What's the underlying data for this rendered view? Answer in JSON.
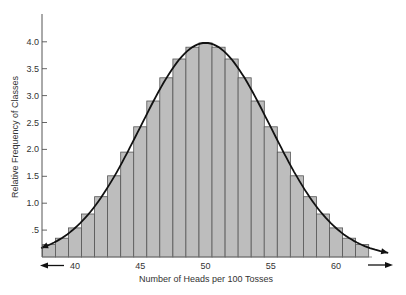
{
  "chart_data": {
    "type": "bar",
    "title": "",
    "xlabel": "Number of Heads per 100 Tosses",
    "ylabel": "Relative Frequency of Classes",
    "categories": [
      38,
      39,
      40,
      41,
      42,
      43,
      44,
      45,
      46,
      47,
      48,
      49,
      50,
      51,
      52,
      53,
      54,
      55,
      56,
      57,
      58,
      59,
      60,
      61,
      62
    ],
    "values": [
      0.23,
      0.35,
      0.54,
      0.8,
      1.12,
      1.51,
      1.95,
      2.42,
      2.9,
      3.33,
      3.68,
      3.9,
      3.98,
      3.9,
      3.68,
      3.33,
      2.9,
      2.42,
      1.95,
      1.51,
      1.12,
      0.8,
      0.54,
      0.35,
      0.23
    ],
    "overlay": {
      "type": "line",
      "name": "normal curve",
      "shape": "bell",
      "arrows_both_ends": true
    },
    "x_ticks": [
      40,
      45,
      50,
      55,
      60
    ],
    "y_ticks": [
      ".5",
      "1.0",
      "1.5",
      "2.0",
      "2.5",
      "3.0",
      "3.5",
      "4.0"
    ],
    "y_tick_values": [
      0.5,
      1.0,
      1.5,
      2.0,
      2.5,
      3.0,
      3.5,
      4.0
    ],
    "ylim": [
      0,
      4.5
    ],
    "xlim": [
      37.5,
      62.5
    ],
    "grid": false,
    "legend": null,
    "x_axis_arrows": [
      "left",
      "right"
    ],
    "colors": {
      "bar_fill": "#bdbdbd",
      "bar_edge": "#555555",
      "curve": "#111111",
      "axis": "#555555"
    }
  }
}
